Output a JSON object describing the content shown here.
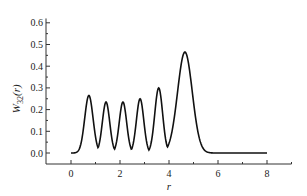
{
  "chart_data": {
    "type": "line",
    "title": "",
    "xlabel": "r",
    "ylabel": "W32(r)",
    "ylabel_main": "W",
    "ylabel_sub": "32",
    "ylabel_arg": "(r)",
    "xlim": [
      -1,
      9
    ],
    "ylim": [
      -0.05,
      0.62
    ],
    "x_ticks": [
      0,
      2,
      4,
      6,
      8
    ],
    "x_tick_labels": [
      "0",
      "2",
      "4",
      "6",
      "8"
    ],
    "x_minor_ticks": [
      1,
      3,
      5,
      7,
      9
    ],
    "y_ticks": [
      0.0,
      0.1,
      0.2,
      0.3,
      0.4,
      0.5,
      0.6
    ],
    "y_tick_labels": [
      "0.0",
      "0.1",
      "0.2",
      "0.3",
      "0.4",
      "0.5",
      "0.6"
    ],
    "y_minor_ticks": [
      0.05,
      0.15,
      0.25,
      0.35,
      0.45,
      0.55
    ],
    "grid": false,
    "legend": null,
    "series": [
      {
        "name": "W32(r)",
        "color": "#111111",
        "peaks": [
          {
            "r": 0.73,
            "value": 0.265,
            "width": 0.17
          },
          {
            "r": 1.43,
            "value": 0.235,
            "width": 0.15
          },
          {
            "r": 2.12,
            "value": 0.235,
            "width": 0.15
          },
          {
            "r": 2.82,
            "value": 0.25,
            "width": 0.15
          },
          {
            "r": 3.58,
            "value": 0.3,
            "width": 0.16
          },
          {
            "r": 4.65,
            "value": 0.465,
            "width": 0.3
          }
        ],
        "x_range": [
          0,
          8
        ],
        "x": [
          0,
          0.3,
          0.73,
          1.08,
          1.43,
          1.78,
          2.12,
          2.47,
          2.82,
          3.2,
          3.58,
          4.0,
          4.65,
          5.2,
          5.7,
          6.0,
          8.0
        ],
        "values": [
          0.0,
          0.02,
          0.265,
          0.0,
          0.235,
          0.0,
          0.235,
          0.0,
          0.25,
          0.0,
          0.3,
          0.01,
          0.465,
          0.16,
          0.02,
          0.0,
          0.0
        ]
      }
    ]
  }
}
